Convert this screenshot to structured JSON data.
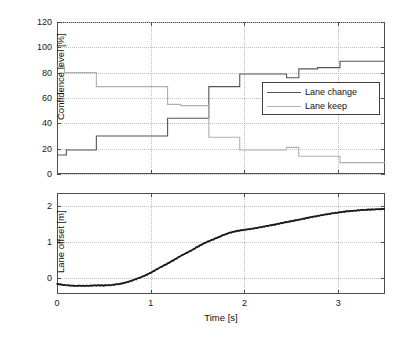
{
  "figure": {
    "background": "#ffffff",
    "axis_color": "#4d4d4d",
    "grid_color": "#bdbdbd"
  },
  "chart_data": [
    {
      "id": "confidence-panel",
      "type": "line",
      "title": "",
      "xlabel": "",
      "ylabel": "Confidence level [%]",
      "xlim": [
        0,
        3.5
      ],
      "ylim": [
        0,
        120
      ],
      "xticks": [
        0,
        1,
        2,
        3
      ],
      "xticklabels": [
        "",
        "",
        "",
        ""
      ],
      "yticks": [
        0,
        20,
        40,
        60,
        80,
        100,
        120
      ],
      "yticklabels": [
        "0",
        "20",
        "40",
        "60",
        "80",
        "100",
        "120"
      ],
      "grid": true,
      "step_plot": true,
      "legend": {
        "position": "center-right",
        "entries": [
          "Lane change",
          "Lane keep"
        ]
      },
      "series": [
        {
          "name": "Lane change",
          "color": "#555555",
          "x": [
            0.0,
            0.1,
            0.42,
            1.18,
            1.32,
            1.62,
            1.95,
            2.45,
            2.58,
            2.78,
            3.02,
            3.5
          ],
          "values": [
            15,
            19,
            30,
            44,
            44,
            69,
            79,
            76,
            83,
            84,
            89,
            89
          ]
        },
        {
          "name": "Lane keep",
          "color": "#b0b0b0",
          "x": [
            0.0,
            0.08,
            0.42,
            1.18,
            1.32,
            1.62,
            1.95,
            2.45,
            2.58,
            2.78,
            3.02,
            3.5
          ],
          "values": [
            85,
            80,
            69,
            55,
            54,
            29,
            19,
            21,
            14,
            14,
            9,
            9
          ]
        }
      ]
    },
    {
      "id": "offset-panel",
      "type": "line",
      "title": "",
      "xlabel": "Time [s]",
      "ylabel": "Lane offset [m]",
      "xlim": [
        0,
        3.5
      ],
      "ylim": [
        -0.45,
        2.35
      ],
      "xticks": [
        0,
        1,
        2,
        3
      ],
      "xticklabels": [
        "0",
        "1",
        "2",
        "3"
      ],
      "yticks": [
        0,
        1,
        2
      ],
      "yticklabels": [
        "0",
        "1",
        "2"
      ],
      "grid": true,
      "series": [
        {
          "name": "Lane offset",
          "color": "#1a1a1a",
          "x": [
            0.0,
            0.08,
            0.17,
            0.25,
            0.33,
            0.42,
            0.5,
            0.58,
            0.67,
            0.75,
            0.83,
            0.92,
            1.0,
            1.08,
            1.17,
            1.25,
            1.33,
            1.42,
            1.5,
            1.58,
            1.67,
            1.75,
            1.83,
            1.92,
            2.0,
            2.08,
            2.17,
            2.25,
            2.33,
            2.42,
            2.5,
            2.58,
            2.67,
            2.75,
            2.83,
            2.92,
            3.0,
            3.08,
            3.17,
            3.25,
            3.33,
            3.42,
            3.5
          ],
          "values": [
            -0.17,
            -0.2,
            -0.22,
            -0.22,
            -0.22,
            -0.21,
            -0.21,
            -0.2,
            -0.17,
            -0.12,
            -0.05,
            0.04,
            0.14,
            0.26,
            0.38,
            0.5,
            0.62,
            0.74,
            0.86,
            0.97,
            1.07,
            1.16,
            1.24,
            1.3,
            1.33,
            1.36,
            1.4,
            1.44,
            1.48,
            1.53,
            1.57,
            1.61,
            1.66,
            1.7,
            1.74,
            1.78,
            1.81,
            1.84,
            1.86,
            1.88,
            1.89,
            1.9,
            1.91
          ]
        }
      ]
    }
  ]
}
